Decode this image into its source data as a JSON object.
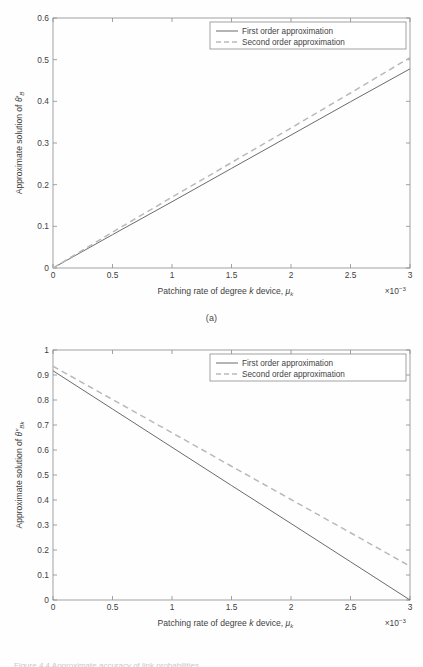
{
  "figure": {
    "panel_a_caption": "(a)",
    "panel_b_caption": "(b)",
    "footnote": "Figure 4.4  Approximate accuracy of link probabilities"
  },
  "legend": {
    "first_order": "First order approximation",
    "second_order": "Second order approximation"
  },
  "axes": {
    "xlabel_prefix": "Patching rate of degree ",
    "xlabel_k": "k",
    "xlabel_suffix": " device, ",
    "xlabel_mu": "μ",
    "xlabel_mu_sub": "k",
    "x_multiplier_base": "×10",
    "x_multiplier_exp": "−3",
    "ylabel_a_prefix": "Approximate solution of ",
    "ylabel_a_symbol": "θ′",
    "ylabel_a_sub": "B",
    "ylabel_b_prefix": "Approximate solution of ",
    "ylabel_b_symbol": "θ″",
    "ylabel_b_sub": "Bk"
  },
  "chart_data": [
    {
      "type": "line",
      "panel": "(a)",
      "title": "",
      "xlabel": "Patching rate of degree k device, μ_k (×10⁻³)",
      "ylabel": "Approximate solution of θ′_B",
      "xlim": [
        0,
        3
      ],
      "ylim": [
        0,
        0.6
      ],
      "xticks": [
        "0",
        "0.5",
        "1",
        "1.5",
        "2",
        "2.5",
        "3"
      ],
      "xtick_values": [
        0,
        0.5,
        1,
        1.5,
        2,
        2.5,
        3
      ],
      "yticks": [
        "0",
        "0.1",
        "0.2",
        "0.3",
        "0.4",
        "0.5",
        "0.6"
      ],
      "ytick_values": [
        0,
        0.1,
        0.2,
        0.3,
        0.4,
        0.5,
        0.6
      ],
      "grid": false,
      "legend_position": "top-right",
      "x_multiplier": 0.001,
      "series": [
        {
          "name": "First order approximation",
          "style": "solid",
          "color": "#6b6b6b",
          "x": [
            0,
            0.5,
            1,
            1.5,
            2,
            2.5,
            3
          ],
          "values": [
            0,
            0.08,
            0.159,
            0.239,
            0.319,
            0.399,
            0.478
          ]
        },
        {
          "name": "Second order approximation",
          "style": "dashed",
          "color": "#b9b9b9",
          "x": [
            0,
            0.5,
            1,
            1.5,
            2,
            2.5,
            3
          ],
          "values": [
            0,
            0.086,
            0.17,
            0.253,
            0.336,
            0.42,
            0.505
          ]
        }
      ]
    },
    {
      "type": "line",
      "panel": "(b)",
      "title": "",
      "xlabel": "Patching rate of degree k device, μ_k (×10⁻³)",
      "ylabel": "Approximate solution of θ″_Bk",
      "xlim": [
        0,
        3
      ],
      "ylim": [
        0,
        1
      ],
      "xticks": [
        "0",
        "0.5",
        "1",
        "1.5",
        "2",
        "2.5",
        "3"
      ],
      "xtick_values": [
        0,
        0.5,
        1,
        1.5,
        2,
        2.5,
        3
      ],
      "yticks": [
        "0",
        "0.1",
        "0.2",
        "0.3",
        "0.4",
        "0.5",
        "0.6",
        "0.7",
        "0.8",
        "0.9",
        "1"
      ],
      "ytick_values": [
        0,
        0.1,
        0.2,
        0.3,
        0.4,
        0.5,
        0.6,
        0.7,
        0.8,
        0.9,
        1
      ],
      "grid": false,
      "legend_position": "top-right",
      "x_multiplier": 0.001,
      "series": [
        {
          "name": "First order approximation",
          "style": "solid",
          "color": "#6b6b6b",
          "x": [
            0,
            0.5,
            1,
            1.5,
            2,
            2.5,
            3
          ],
          "values": [
            0.917,
            0.764,
            0.611,
            0.458,
            0.306,
            0.153,
            0
          ]
        },
        {
          "name": "Second order approximation",
          "style": "dashed",
          "color": "#b9b9b9",
          "x": [
            0,
            0.5,
            1,
            1.5,
            2,
            2.5,
            3
          ],
          "values": [
            0.935,
            0.802,
            0.669,
            0.535,
            0.402,
            0.269,
            0.135
          ]
        }
      ]
    }
  ]
}
